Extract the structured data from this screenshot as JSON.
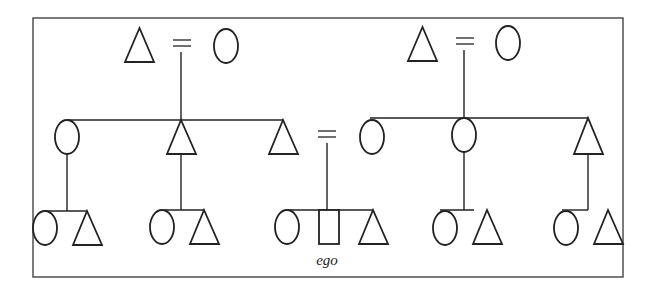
{
  "diagram": {
    "type": "kinship-chart",
    "legend_symbols": {
      "triangle": "male",
      "circle": "female",
      "square": "ego",
      "equals": "marriage",
      "horizontal-line": "sibling link",
      "vertical-line": "descent"
    },
    "ego_label": "ego",
    "generations": [
      {
        "level": 1,
        "couples": [
          {
            "id": "left-grandparents",
            "members": [
              "male",
              "female"
            ]
          },
          {
            "id": "right-grandparents",
            "members": [
              "male",
              "female"
            ]
          }
        ]
      },
      {
        "level": 2,
        "sibling_sets": [
          {
            "parents": "left-grandparents",
            "children": [
              "female",
              "male",
              "male (ego's father)"
            ]
          },
          {
            "parents": "right-grandparents",
            "children": [
              "female (ego's mother)",
              "female",
              "male"
            ]
          }
        ],
        "marriage": "ego's father = ego's mother"
      },
      {
        "level": 3,
        "sibling_sets": [
          {
            "parent": "father's sister",
            "children": [
              "female",
              "male"
            ]
          },
          {
            "parent": "father's brother",
            "children": [
              "female",
              "male"
            ]
          },
          {
            "parent": "ego's parents",
            "children": [
              "female",
              "ego",
              "male"
            ]
          },
          {
            "parent": "mother's sister",
            "children": [
              "female",
              "male"
            ]
          },
          {
            "parent": "mother's brother",
            "children": [
              "female",
              "male"
            ]
          }
        ]
      }
    ]
  }
}
